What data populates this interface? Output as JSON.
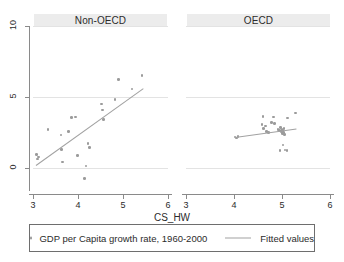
{
  "chart_data": {
    "type": "scatter",
    "title": "",
    "xlabel": "CS_HW",
    "ylabel": "",
    "xlim": [
      3,
      6
    ],
    "ylim": [
      -1.55,
      10
    ],
    "xticks": [
      3,
      4,
      5,
      6
    ],
    "yticks": [
      0,
      5,
      10
    ],
    "xtick_labels": [
      "3",
      "4",
      "5",
      "6"
    ],
    "ytick_labels": [
      "0",
      "5",
      "10"
    ],
    "grid": true,
    "legend_position": "bottom",
    "panel_layout": "side-by-side",
    "panels": [
      {
        "name": "non-oecd",
        "title": "Non-OECD",
        "series": [
          {
            "name": "GDP per Capita growth rate, 1960-2000",
            "type": "scatter",
            "color": "#9b9b9b",
            "points": [
              {
                "x": 3.08,
                "y": 0.95
              },
              {
                "x": 3.1,
                "y": 0.62
              },
              {
                "x": 3.12,
                "y": 0.78
              },
              {
                "x": 3.33,
                "y": 2.72
              },
              {
                "x": 3.62,
                "y": 2.32
              },
              {
                "x": 3.63,
                "y": 1.32
              },
              {
                "x": 3.66,
                "y": 0.42
              },
              {
                "x": 3.79,
                "y": 2.55
              },
              {
                "x": 3.86,
                "y": 3.55
              },
              {
                "x": 3.95,
                "y": 3.58
              },
              {
                "x": 3.99,
                "y": 0.9
              },
              {
                "x": 4.15,
                "y": -0.72
              },
              {
                "x": 4.18,
                "y": 0.15
              },
              {
                "x": 4.22,
                "y": 1.72
              },
              {
                "x": 4.26,
                "y": 1.45
              },
              {
                "x": 4.52,
                "y": 4.52
              },
              {
                "x": 4.55,
                "y": 4.08
              },
              {
                "x": 4.57,
                "y": 3.42
              },
              {
                "x": 4.82,
                "y": 4.82
              },
              {
                "x": 4.9,
                "y": 6.25
              },
              {
                "x": 5.2,
                "y": 5.55
              },
              {
                "x": 5.42,
                "y": 6.52
              }
            ]
          },
          {
            "name": "Fitted values",
            "type": "line",
            "color": "#a2a2a2",
            "endpoints": [
              {
                "x": 3.06,
                "y": 0.2
              },
              {
                "x": 5.45,
                "y": 5.62
              }
            ]
          }
        ]
      },
      {
        "name": "oecd",
        "title": "OECD",
        "series": [
          {
            "name": "GDP per Capita growth rate, 1960-2000",
            "type": "scatter",
            "color": "#9b9b9b",
            "points": [
              {
                "x": 4.02,
                "y": 2.18
              },
              {
                "x": 4.05,
                "y": 2.12
              },
              {
                "x": 4.08,
                "y": 2.22
              },
              {
                "x": 4.58,
                "y": 3.05
              },
              {
                "x": 4.6,
                "y": 3.62
              },
              {
                "x": 4.62,
                "y": 2.78
              },
              {
                "x": 4.66,
                "y": 2.95
              },
              {
                "x": 4.68,
                "y": 2.55
              },
              {
                "x": 4.72,
                "y": 2.48
              },
              {
                "x": 4.78,
                "y": 3.22
              },
              {
                "x": 4.82,
                "y": 3.58
              },
              {
                "x": 4.84,
                "y": 3.12
              },
              {
                "x": 4.92,
                "y": 2.72
              },
              {
                "x": 4.95,
                "y": 2.62
              },
              {
                "x": 4.97,
                "y": 2.85
              },
              {
                "x": 4.99,
                "y": 2.55
              },
              {
                "x": 5.0,
                "y": 2.7
              },
              {
                "x": 5.01,
                "y": 2.42
              },
              {
                "x": 5.02,
                "y": 2.62
              },
              {
                "x": 5.03,
                "y": 2.48
              },
              {
                "x": 5.04,
                "y": 2.78
              },
              {
                "x": 5.05,
                "y": 2.35
              },
              {
                "x": 5.02,
                "y": 1.62
              },
              {
                "x": 5.06,
                "y": 1.28
              },
              {
                "x": 5.1,
                "y": 1.22
              },
              {
                "x": 4.96,
                "y": 1.25
              },
              {
                "x": 5.12,
                "y": 3.52
              },
              {
                "x": 5.28,
                "y": 3.88
              }
            ]
          },
          {
            "name": "Fitted values",
            "type": "line",
            "color": "#a2a2a2",
            "endpoints": [
              {
                "x": 4.02,
                "y": 2.18
              },
              {
                "x": 5.3,
                "y": 2.78
              }
            ]
          }
        ]
      }
    ]
  },
  "legend": {
    "scatter_label": "GDP per Capita growth rate, 1960-2000",
    "line_label": "Fitted values"
  },
  "axis": {
    "x_title": "CS_HW"
  },
  "colors": {
    "marker": "#9b9b9b",
    "fit_line": "#a2a2a2",
    "gridline": "#e3e3e3",
    "axis": "#8a8a8a",
    "panel_header_bg": "#ececec",
    "text": "#2b2b2b"
  }
}
